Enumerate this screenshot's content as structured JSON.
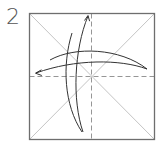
{
  "diagram": {
    "step_number": "2",
    "type": "origami-fold-step",
    "colors": {
      "paper_border": "#6e6e6e",
      "diagonal_crease": "#b0b0b0",
      "valley_fold_dashed": "#8a8a8a",
      "arrow": "#333333"
    },
    "elements": [
      {
        "kind": "square-paper",
        "label": "square sheet"
      },
      {
        "kind": "diagonal-crease",
        "label": "top-left to bottom-right"
      },
      {
        "kind": "diagonal-crease",
        "label": "top-right to bottom-left"
      },
      {
        "kind": "dashed-fold-line",
        "orientation": "vertical",
        "label": "vertical center fold"
      },
      {
        "kind": "dashed-fold-line",
        "orientation": "horizontal",
        "label": "horizontal center fold"
      },
      {
        "kind": "fold-unfold-arrow",
        "direction": "up",
        "label": "fold bottom up and unfold"
      },
      {
        "kind": "fold-unfold-arrow",
        "direction": "left",
        "label": "fold right to left and unfold"
      }
    ]
  }
}
